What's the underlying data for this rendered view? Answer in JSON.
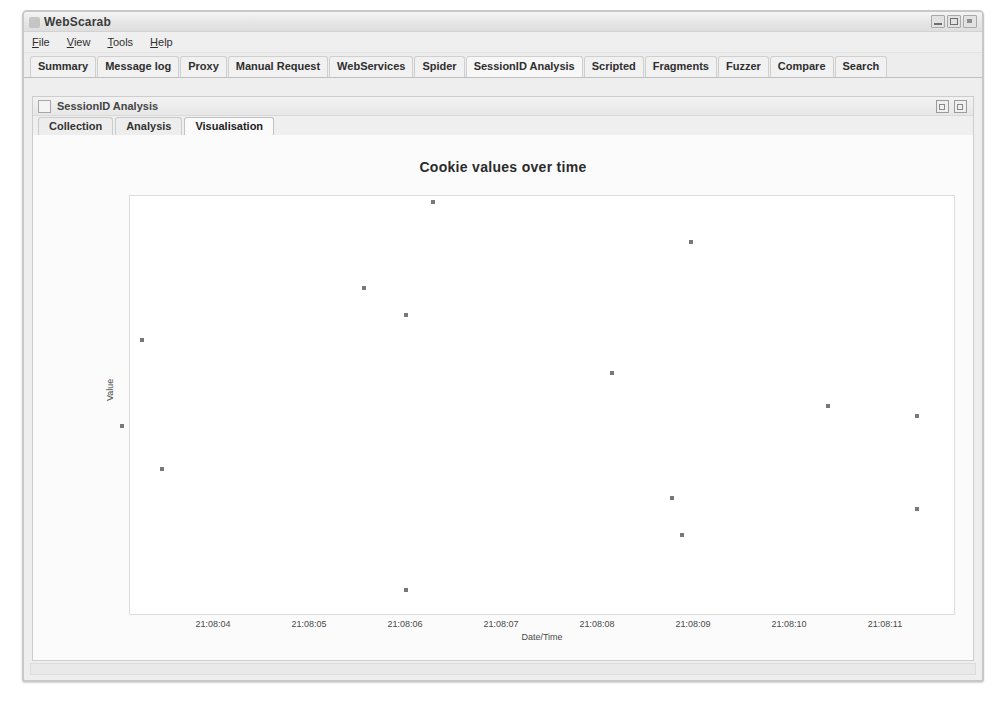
{
  "window": {
    "title": "WebScarab",
    "app_icon": "webscarab-icon",
    "controls": [
      {
        "name": "minimize-button",
        "glyph": "minimize-icon"
      },
      {
        "name": "maximize-button",
        "glyph": "maximize-icon"
      },
      {
        "name": "close-button",
        "glyph": "close-icon"
      }
    ]
  },
  "menu": {
    "items": [
      {
        "label": "File",
        "mnemonic": "F",
        "rest": "ile"
      },
      {
        "label": "View",
        "mnemonic": "V",
        "rest": "iew"
      },
      {
        "label": "Tools",
        "mnemonic": "T",
        "rest": "ools"
      },
      {
        "label": "Help",
        "mnemonic": "H",
        "rest": "elp"
      }
    ]
  },
  "tabs": {
    "items": [
      {
        "label": "Summary",
        "selected": false
      },
      {
        "label": "Message log",
        "selected": false
      },
      {
        "label": "Proxy",
        "selected": false
      },
      {
        "label": "Manual Request",
        "selected": false
      },
      {
        "label": "WebServices",
        "selected": false
      },
      {
        "label": "Spider",
        "selected": false
      },
      {
        "label": "SessionID Analysis",
        "selected": true
      },
      {
        "label": "Scripted",
        "selected": false
      },
      {
        "label": "Fragments",
        "selected": false
      },
      {
        "label": "Fuzzer",
        "selected": false
      },
      {
        "label": "Compare",
        "selected": false
      },
      {
        "label": "Search",
        "selected": false
      }
    ]
  },
  "internal_frame": {
    "title": "SessionID Analysis",
    "controls": [
      {
        "name": "frame-restore-button"
      },
      {
        "name": "frame-maximize-button"
      }
    ],
    "tabs": [
      {
        "label": "Collection",
        "selected": false
      },
      {
        "label": "Analysis",
        "selected": false
      },
      {
        "label": "Visualisation",
        "selected": true
      }
    ]
  },
  "chart_data": {
    "type": "scatter",
    "title": "Cookie values over time",
    "xlabel": "Date/Time",
    "ylabel": "Value",
    "grid": false,
    "legend": false,
    "xtick_labels": [
      "21:08:04",
      "21:08:05",
      "21:08:06",
      "21:08:07",
      "21:08:08",
      "21:08:09",
      "21:08:10",
      "21:08:11"
    ],
    "ytick_labels": [],
    "xlim": [
      "21:08:03.4",
      "21:08:11.6"
    ],
    "marker": "square",
    "marker_color": "#787878",
    "points": [
      {
        "x": "21:08:03.67",
        "y": 0.475,
        "px": 118,
        "py": 431
      },
      {
        "x": "21:08:03.88",
        "y": 0.716,
        "px": 138,
        "py": 345
      },
      {
        "x": "21:08:04.08",
        "y": 0.373,
        "px": 158,
        "py": 474
      },
      {
        "x": "21:08:06.00",
        "y": 0.855,
        "px": 360,
        "py": 293
      },
      {
        "x": "21:08:06.44",
        "y": 0.79,
        "px": 402,
        "py": 320
      },
      {
        "x": "21:08:06.44",
        "y": 0.047,
        "px": 402,
        "py": 595
      },
      {
        "x": "21:08:06.71",
        "y": 1.003,
        "px": 429,
        "py": 207
      },
      {
        "x": "21:08:08.52",
        "y": 0.63,
        "px": 608,
        "py": 378
      },
      {
        "x": "21:08:09.15",
        "y": 0.315,
        "px": 668,
        "py": 503
      },
      {
        "x": "21:08:09.25",
        "y": 0.225,
        "px": 678,
        "py": 540
      },
      {
        "x": "21:08:09.35",
        "y": 0.905,
        "px": 687,
        "py": 247
      },
      {
        "x": "21:08:10.78",
        "y": 0.55,
        "px": 824,
        "py": 411
      },
      {
        "x": "21:08:11.71",
        "y": 0.526,
        "px": 913,
        "py": 421
      },
      {
        "x": "21:08:11.71",
        "y": 0.289,
        "px": 913,
        "py": 514
      }
    ]
  }
}
